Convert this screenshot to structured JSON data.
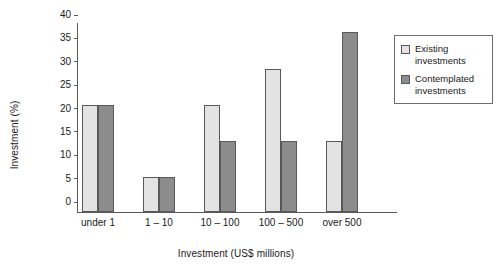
{
  "chart_data": {
    "type": "bar",
    "title": "",
    "xlabel": "Investment (US$ millions)",
    "ylabel": "Investment (%)",
    "categories": [
      "under 1",
      "1 – 10",
      "10 – 100",
      "100 – 500",
      "over 500"
    ],
    "series": [
      {
        "name": "Existing investments",
        "color": "#e3e3e3",
        "values": [
          22.8,
          7.5,
          22.8,
          30.6,
          15.2
        ]
      },
      {
        "name": "Contemplated investments",
        "color": "#8c8c8c",
        "values": [
          22.8,
          7.5,
          15.2,
          15.2,
          38.4
        ]
      }
    ],
    "ylim": [
      0,
      40
    ],
    "ytick_step": 5,
    "yticks": [
      "0",
      "5",
      "10",
      "15",
      "20",
      "25",
      "30",
      "35",
      "40"
    ],
    "grid": false,
    "legend_position": "top-right",
    "legend_entries": [
      {
        "label_line1": "Existing",
        "label_line2": "investments",
        "swatch": "existing"
      },
      {
        "label_line1": "Contemplated",
        "label_line2": "investments",
        "swatch": "contemplated"
      }
    ]
  }
}
